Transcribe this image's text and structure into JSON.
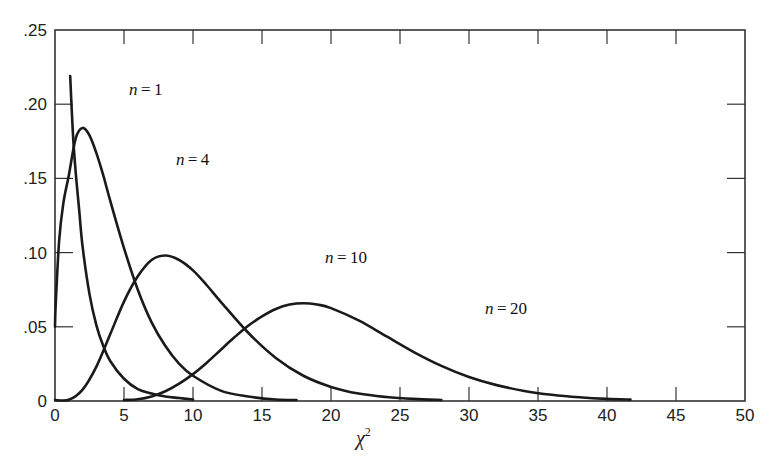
{
  "chart_data": {
    "type": "line",
    "title": "",
    "xlabel": "χ²",
    "ylabel": "",
    "xlim": [
      0,
      50
    ],
    "ylim": [
      0,
      0.25
    ],
    "grid": false,
    "legend": "inline curve labels",
    "x_ticks": [
      0,
      5,
      10,
      15,
      20,
      25,
      30,
      35,
      40,
      45,
      50
    ],
    "x_tick_labels": [
      "0",
      "5",
      "10",
      "15",
      "20",
      "25",
      "30",
      "35",
      "40",
      "45",
      "50"
    ],
    "y_ticks": [
      0,
      0.05,
      0.1,
      0.15,
      0.2,
      0.25
    ],
    "y_tick_labels": [
      "0",
      ".05",
      ".10",
      ".15",
      ".20",
      ".25"
    ],
    "series": [
      {
        "name": "n = 1",
        "label_var": "n",
        "label_rest": " = 1",
        "label_pos": [
          5.8,
          0.21
        ],
        "x": [
          1.1,
          1.3,
          1.5,
          1.75,
          2,
          2.5,
          3,
          3.5,
          4,
          5,
          6,
          7,
          8,
          9,
          10
        ],
        "values": [
          0.219,
          0.18,
          0.154,
          0.129,
          0.104,
          0.072,
          0.051,
          0.037,
          0.027,
          0.015,
          0.008,
          0.005,
          0.003,
          0.002,
          0.001
        ]
      },
      {
        "name": "n = 4",
        "label_var": "n",
        "label_rest": " = 4",
        "label_pos": [
          9.2,
          0.163
        ],
        "x": [
          0,
          0.05,
          0.3,
          0.6,
          1,
          1.5,
          2,
          2.5,
          3,
          3.5,
          4,
          5,
          6,
          7,
          8,
          9,
          10,
          12,
          14,
          16,
          17.5
        ],
        "values": [
          0.05,
          0.065,
          0.108,
          0.133,
          0.152,
          0.177,
          0.184,
          0.179,
          0.167,
          0.152,
          0.135,
          0.103,
          0.075,
          0.053,
          0.037,
          0.025,
          0.017,
          0.007,
          0.003,
          0.001,
          0.0005
        ]
      },
      {
        "name": "n = 10",
        "label_var": "n",
        "label_rest": " = 10",
        "label_pos": [
          20.0,
          0.097
        ],
        "x": [
          0,
          1,
          2,
          3,
          4,
          5,
          6,
          7,
          8,
          9,
          10,
          11,
          12,
          14,
          16,
          18,
          20,
          22,
          24,
          26,
          28
        ],
        "values": [
          0,
          0.0008,
          0.0077,
          0.0232,
          0.045,
          0.067,
          0.084,
          0.095,
          0.098,
          0.095,
          0.088,
          0.078,
          0.067,
          0.046,
          0.029,
          0.017,
          0.0095,
          0.005,
          0.0027,
          0.0014,
          0.0007
        ]
      },
      {
        "name": "n = 20",
        "label_var": "n",
        "label_rest": " = 20",
        "label_pos": [
          31.6,
          0.063
        ],
        "x": [
          5,
          6,
          7,
          8,
          9,
          10,
          11,
          12,
          13,
          14,
          15,
          16,
          17,
          18,
          19,
          20,
          22,
          24,
          26,
          28,
          30,
          32,
          34,
          36,
          38,
          40,
          41.7
        ],
        "values": [
          0.0004,
          0.0012,
          0.0031,
          0.0066,
          0.0117,
          0.0181,
          0.0258,
          0.0344,
          0.0429,
          0.0507,
          0.057,
          0.062,
          0.065,
          0.0659,
          0.065,
          0.0626,
          0.0543,
          0.0437,
          0.033,
          0.0237,
          0.0162,
          0.0107,
          0.0068,
          0.0042,
          0.0025,
          0.0014,
          0.0009
        ]
      }
    ]
  },
  "style": {
    "line_color": "#1a1a1a",
    "frame_color": "#333333",
    "background": "#ffffff"
  }
}
